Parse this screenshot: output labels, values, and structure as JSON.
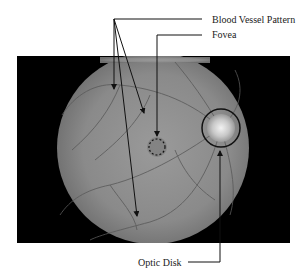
{
  "diagram": {
    "labels": {
      "blood_vessel": "Blood Vessel Pattern",
      "fovea": "Fovea",
      "optic_disk": "Optic Disk"
    },
    "colors": {
      "background": "#ffffff",
      "frame": "#000000",
      "retina": "#8e8e8e",
      "line": "#111111"
    }
  }
}
